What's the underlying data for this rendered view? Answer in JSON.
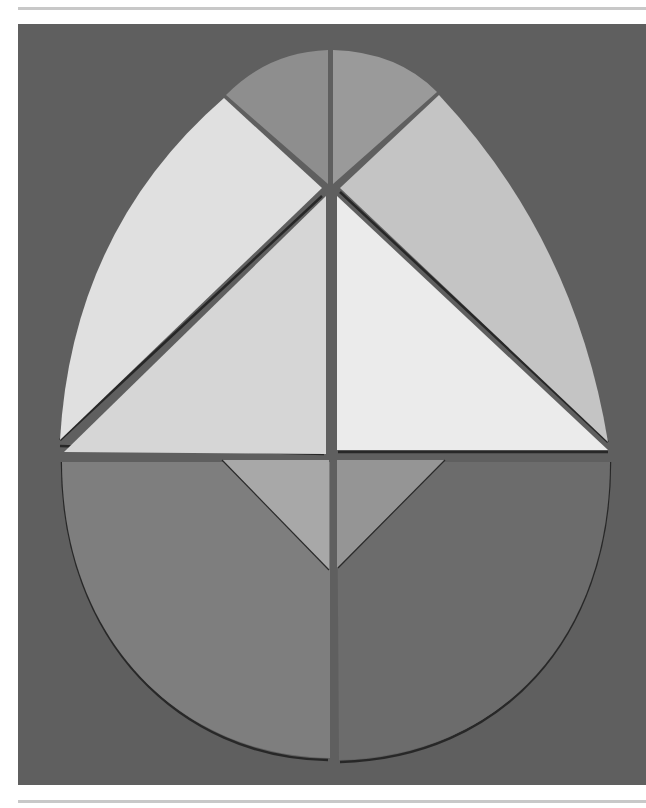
{
  "image": {
    "subject": "egg tangram puzzle pieces on gray paper background",
    "alt": "Egg-shaped tangram made of nine grayscale paper pieces",
    "colors": {
      "background": "#5f5f5f",
      "rule": "#c8c8c8",
      "cap_left": "#8e8e8e",
      "cap_right": "#9a9a9a",
      "upper_left_curve": "#e0e0e0",
      "upper_right_curve": "#c4c4c4",
      "big_triangle_left": "#d6d6d6",
      "big_triangle_right": "#ebebeb",
      "lower_left_half": "#7e7e7e",
      "lower_right_half": "#6c6c6c",
      "small_triangle_left": "#a8a8a8",
      "small_triangle_right": "#959595",
      "shadow": "#1e1e1e"
    },
    "pieces": [
      {
        "name": "top-cap-left-sector"
      },
      {
        "name": "top-cap-right-sector"
      },
      {
        "name": "upper-left-curved-piece"
      },
      {
        "name": "upper-right-curved-piece"
      },
      {
        "name": "large-left-triangle"
      },
      {
        "name": "large-right-triangle"
      },
      {
        "name": "lower-left-half-disk"
      },
      {
        "name": "lower-right-half-disk"
      },
      {
        "name": "small-left-triangle"
      },
      {
        "name": "small-right-triangle"
      }
    ]
  }
}
